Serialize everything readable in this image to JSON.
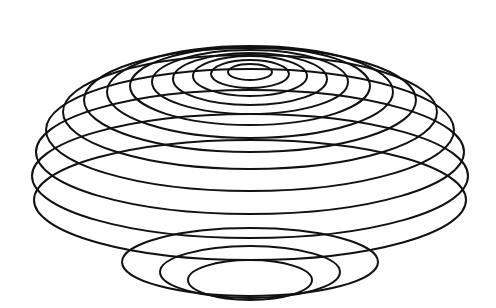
{
  "figure": {
    "description": "Line drawing of a bowl-shaped paraboloid rendered as a stack of nested concentric ellipses, each larger ring positioned lower than the one inside it.",
    "canvas": {
      "width": 496,
      "height": 308
    },
    "background_color": "#ffffff",
    "stroke_color": "#111111",
    "stroke_width": 2,
    "ring_count": 13,
    "center_x": 250,
    "apex_y": 72,
    "rim_y": 92,
    "floor_y": 272
  },
  "chart_data": {
    "type": "line",
    "subtitle": "Nested concentric ellipses forming a bowl",
    "xlabel": "",
    "ylabel": "",
    "xlim": [
      0,
      496
    ],
    "ylim": [
      0,
      308
    ],
    "grid": false,
    "legend": "none",
    "annotations": [],
    "tick_labels": {
      "x": [],
      "y": []
    },
    "series": [
      {
        "name": "ring-1-apex",
        "cx": 250,
        "cy": 72,
        "rx": 22,
        "ry": 8
      },
      {
        "name": "ring-2",
        "cx": 250,
        "cy": 74,
        "rx": 39,
        "ry": 14
      },
      {
        "name": "ring-3",
        "cx": 250,
        "cy": 76,
        "rx": 57,
        "ry": 20
      },
      {
        "name": "ring-4",
        "cx": 250,
        "cy": 79,
        "rx": 77,
        "ry": 26
      },
      {
        "name": "ring-5",
        "cx": 250,
        "cy": 82,
        "rx": 98,
        "ry": 32
      },
      {
        "name": "ring-6",
        "cx": 250,
        "cy": 86,
        "rx": 120,
        "ry": 39
      },
      {
        "name": "ring-7",
        "cx": 250,
        "cy": 92,
        "rx": 143,
        "ry": 46
      },
      {
        "name": "ring-8",
        "cx": 250,
        "cy": 100,
        "rx": 166,
        "ry": 52
      },
      {
        "name": "ring-9",
        "cx": 250,
        "cy": 112,
        "rx": 187,
        "ry": 57
      },
      {
        "name": "ring-10",
        "cx": 250,
        "cy": 130,
        "rx": 204,
        "ry": 61
      },
      {
        "name": "ring-11",
        "cx": 250,
        "cy": 152,
        "rx": 214,
        "ry": 62
      },
      {
        "name": "ring-12",
        "cx": 250,
        "cy": 176,
        "rx": 218,
        "ry": 62
      },
      {
        "name": "ring-13-rim",
        "cx": 250,
        "cy": 200,
        "rx": 216,
        "ry": 60
      }
    ],
    "inner_floor_series": [
      {
        "name": "floor-ring-1",
        "cx": 250,
        "cy": 262,
        "rx": 128,
        "ry": 34
      },
      {
        "name": "floor-ring-2",
        "cx": 250,
        "cy": 272,
        "rx": 90,
        "ry": 26
      },
      {
        "name": "floor-ring-3",
        "cx": 250,
        "cy": 280,
        "rx": 62,
        "ry": 20
      }
    ]
  }
}
